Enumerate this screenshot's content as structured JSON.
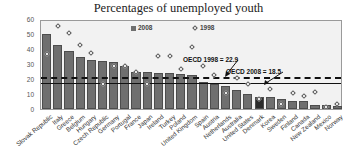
{
  "chart_data": {
    "type": "bar",
    "title": "Percentages of unemployed youth",
    "xlabel": "",
    "ylabel": "",
    "ylim": [
      0,
      60
    ],
    "yticks": [
      0,
      10,
      20,
      30,
      40,
      50,
      60
    ],
    "grid": false,
    "legend_position": "top-inside",
    "categories": [
      "Slovak Republic",
      "Italy",
      "Greece",
      "Belgium",
      "Hungary",
      "Czech Republic",
      "Germany",
      "Portugal",
      "France",
      "Japan",
      "Ireland",
      "Turkey",
      "Poland",
      "United Kingdom",
      "Spain",
      "Austria",
      "Netherlands",
      "Australia",
      "United States",
      "Denmark",
      "Korea",
      "Sweden",
      "Finland",
      "Canada",
      "New Zealand",
      "Mexico",
      "Norway"
    ],
    "series": [
      {
        "name": "2008",
        "style": "bar",
        "values": [
          50,
          43,
          39,
          35,
          33,
          32,
          31.5,
          29,
          25,
          24.5,
          24,
          24,
          23.5,
          23,
          18,
          17,
          15.5,
          12.5,
          10,
          8,
          8,
          7,
          5.5,
          5.5,
          3,
          3,
          2
        ]
      },
      {
        "name": "1998",
        "style": "marker",
        "values": [
          38,
          57,
          52,
          44,
          39,
          18,
          30,
          30,
          26,
          18,
          37,
          37,
          28,
          43,
          30,
          24,
          12,
          22,
          18,
          8,
          15,
          5,
          12,
          10,
          13,
          3,
          5
        ]
      }
    ],
    "reference_lines": [
      {
        "label": "OECD 1998 = 22.9",
        "value": 22.9,
        "style": "dashed"
      },
      {
        "label": "OECD 2008 = 18.5",
        "value": 18.5,
        "style": "solid"
      }
    ],
    "highlight_category": "Denmark"
  },
  "legend": {
    "item_2008": "2008",
    "item_1998": "1998"
  },
  "annotations": {
    "oecd_1998": "OECD 1998 = 22.9",
    "oecd_2008": "OECD 2008 = 18.5"
  }
}
